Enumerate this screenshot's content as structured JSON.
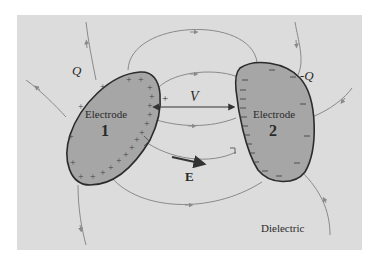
{
  "diagram": {
    "background_color": "#dcdcdc",
    "electrode_fill": "#a6a6a6",
    "line_color": "#8a8a8a",
    "outline_color": "#2b2b2b",
    "electrode1": {
      "label": "Electrode",
      "number": "1",
      "charge_label": "Q",
      "charge_sign": "+"
    },
    "electrode2": {
      "label": "Electrode",
      "number": "2",
      "charge_label": "-Q",
      "charge_sign": "−"
    },
    "voltage_label": "V",
    "voltage_plus": "+",
    "field_label": "E",
    "medium_label": "Dielectric"
  }
}
